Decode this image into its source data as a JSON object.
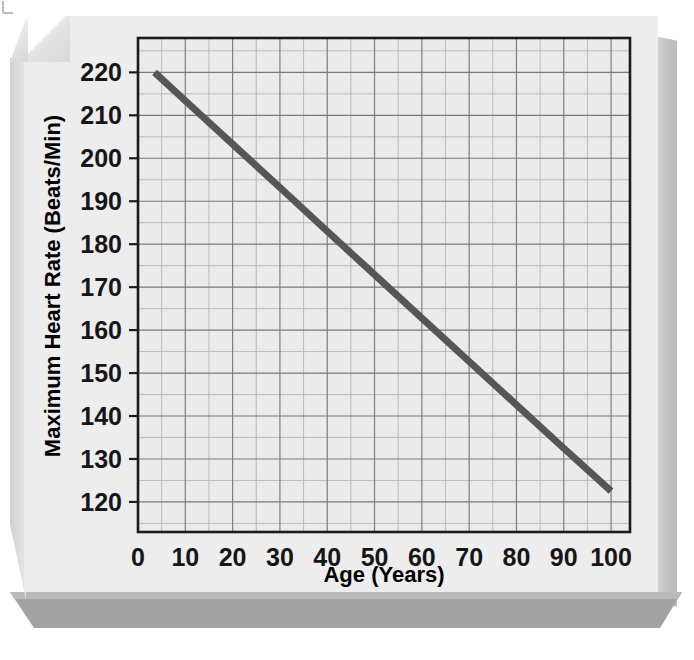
{
  "chart_data": {
    "type": "line",
    "title": "",
    "xlabel": "Age (Years)",
    "ylabel": "Maximum Heart Rate (Beats/Min)",
    "xlim": [
      0,
      104
    ],
    "ylim": [
      113,
      228
    ],
    "xticks": [
      0,
      10,
      20,
      30,
      40,
      50,
      60,
      70,
      80,
      90,
      100
    ],
    "yticks": [
      120,
      130,
      140,
      150,
      160,
      170,
      180,
      190,
      200,
      210,
      220
    ],
    "xtick_labels": [
      "0",
      "10",
      "20",
      "30",
      "40",
      "50",
      "60",
      "70",
      "80",
      "90",
      "100"
    ],
    "ytick_labels": [
      "120",
      "130",
      "140",
      "150",
      "160",
      "170",
      "180",
      "190",
      "200",
      "210",
      "220"
    ],
    "x_minor_step": 5,
    "y_minor_step": 5,
    "grid": true,
    "legend": false,
    "series": [
      {
        "name": "Maximum Heart Rate",
        "color": "#565656",
        "linewidth": 7,
        "x": [
          3.5,
          100
        ],
        "y": [
          220,
          122.5
        ],
        "points": [
          {
            "x": 3.5,
            "y": 220
          },
          {
            "x": 10,
            "y": 213.4
          },
          {
            "x": 20,
            "y": 203.3
          },
          {
            "x": 30,
            "y": 193.2
          },
          {
            "x": 40,
            "y": 183.0
          },
          {
            "x": 50,
            "y": 172.9
          },
          {
            "x": 60,
            "y": 162.8
          },
          {
            "x": 70,
            "y": 152.7
          },
          {
            "x": 80,
            "y": 142.6
          },
          {
            "x": 90,
            "y": 132.5
          },
          {
            "x": 100,
            "y": 122.5
          }
        ]
      }
    ]
  },
  "colors": {
    "plot_background": "#ebebeb",
    "panel_background": "#ededed",
    "panel_shadow": "#a3a3a3",
    "line": "#565656",
    "axis": "#1b1b1b",
    "major_grid": "#7a7a7a",
    "minor_grid": "#b4b4b4"
  }
}
